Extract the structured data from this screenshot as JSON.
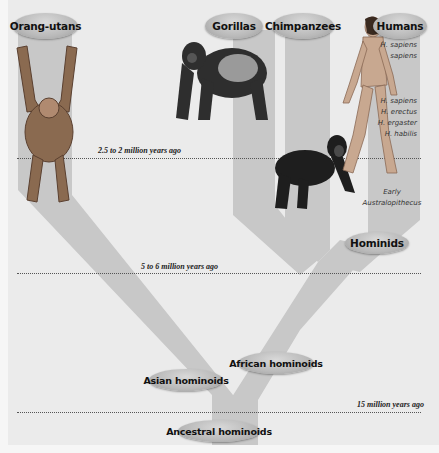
{
  "diagram": {
    "colors": {
      "background": "#ebebeb",
      "branch": "#c8c8c8",
      "oval": "#b9b9b9",
      "line": "#555555"
    },
    "groups": {
      "orangutans": "Orang-utans",
      "gorillas": "Gorillas",
      "chimpanzees": "Chimpanzees",
      "humans": "Humans"
    },
    "nodes": {
      "hominids": "Hominids",
      "african_hominoids": "African hominoids",
      "asian_hominoids": "Asian hominoids",
      "ancestral_hominoids": "Ancestral hominoids"
    },
    "human_species": {
      "sapiens_sapiens_1": "H. sapiens",
      "sapiens_sapiens_2": "sapiens",
      "sapiens": "H. sapiens",
      "erectus": "H. erectus",
      "ergaster": "H. ergaster",
      "habilis": "H. habilis",
      "australopithecus_1": "Early",
      "australopithecus_2": "Australopithecus"
    },
    "time_markers": {
      "t1": "2.5 to 2 million years ago",
      "t2": "5 to 6 million years ago",
      "t3": "15 million years ago"
    },
    "illustrations": [
      "orangutan-illustration",
      "gorilla-illustration",
      "chimpanzee-illustration",
      "human-illustration"
    ]
  }
}
